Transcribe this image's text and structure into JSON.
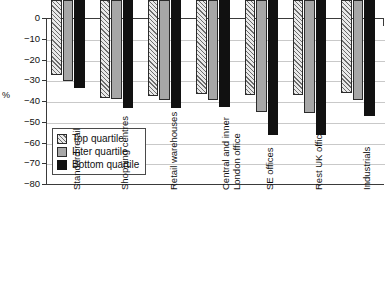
{
  "chart_data": {
    "type": "bar",
    "title": "",
    "xlabel": "",
    "ylabel": "%",
    "ylim": [
      -80,
      0
    ],
    "ytick_labels": [
      "0",
      "−10",
      "−20",
      "−30",
      "−40",
      "−50",
      "−60",
      "−70",
      "−80"
    ],
    "ytick_values": [
      0,
      -10,
      -20,
      -30,
      -40,
      -50,
      -60,
      -70,
      -80
    ],
    "grid": true,
    "legend_position": "inside-lower-left",
    "categories": [
      "Standard retail",
      "Shopping centres",
      "Retail warehouses",
      "Central and inner\nLondon office",
      "SE offices",
      "Rest UK offices",
      "Industrials"
    ],
    "series": [
      {
        "name": "Top quartile",
        "values": [
          -36,
          -47,
          -46.5,
          -45.5,
          -46,
          -46,
          -45
        ]
      },
      {
        "name": "Inter quartile",
        "values": [
          -39,
          -47.5,
          -48,
          -48,
          -54,
          -54.5,
          -48
        ]
      },
      {
        "name": "Bottom quartile",
        "values": [
          -42.5,
          -52,
          -52,
          -51.5,
          -65,
          -65,
          -56
        ]
      }
    ]
  },
  "legend": {
    "items": [
      {
        "label": "Top quartile",
        "key": "top-quartile"
      },
      {
        "label": "Inter quartile",
        "key": "inter-quartile"
      },
      {
        "label": "Bottom quartile",
        "key": "bottom-quartile"
      }
    ]
  },
  "colors": {
    "top_quartile": "#e9e9e9",
    "inter_quartile": "#a7a7a7",
    "bottom_quartile": "#111111",
    "axis": "#3a3a3a",
    "gridline": "#c9c9c9",
    "background": "#ffffff"
  }
}
